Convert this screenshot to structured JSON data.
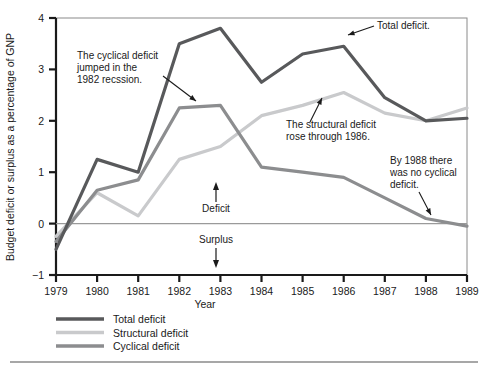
{
  "chart_data": {
    "type": "line",
    "title": "",
    "xlabel": "Year",
    "ylabel": "Budget deficit or surplus as a percentage of GNP",
    "x": [
      1979,
      1980,
      1981,
      1982,
      1983,
      1984,
      1985,
      1986,
      1987,
      1988,
      1989
    ],
    "categories": [
      "1979",
      "1980",
      "1981",
      "1982",
      "1983",
      "1984",
      "1985",
      "1986",
      "1987",
      "1988",
      "1989"
    ],
    "xlim": [
      1979,
      1989
    ],
    "ylim": [
      -1,
      4
    ],
    "yticks": [
      "-1",
      "0",
      "1",
      "2",
      "3",
      "4"
    ],
    "ytick_values": [
      -1,
      0,
      1,
      2,
      3,
      4
    ],
    "grid": false,
    "legend_position": "below-left",
    "zero_line": 0,
    "series": [
      {
        "name": "Total deficit",
        "color": "#58595b",
        "width": 3.2,
        "values": [
          -0.5,
          1.25,
          1.0,
          3.5,
          3.8,
          2.75,
          3.3,
          3.45,
          2.45,
          2.0,
          2.05
        ]
      },
      {
        "name": "Structural deficit",
        "color": "#c9cacc",
        "width": 3.2,
        "values": [
          -0.25,
          0.6,
          0.15,
          1.25,
          1.5,
          2.1,
          2.3,
          2.55,
          2.15,
          2.0,
          2.25
        ]
      },
      {
        "name": "Cyclical deficit",
        "color": "#8c8d8f",
        "width": 3.2,
        "values": [
          -0.35,
          0.65,
          0.85,
          2.25,
          2.3,
          1.1,
          1.0,
          0.9,
          0.5,
          0.1,
          -0.05
        ]
      }
    ],
    "annotations": [
      {
        "id": "cyclical-recession-note",
        "text_lines": [
          "The cyclical deficit",
          "jumped in the",
          "1982 recssion."
        ],
        "text_x": 77,
        "text_y": 59,
        "arrow": {
          "x1": 163,
          "y1": 76,
          "x2": 196,
          "y2": 101
        }
      },
      {
        "id": "structural-rose-note",
        "text_lines": [
          "The structural deficit",
          "rose through 1986."
        ],
        "text_x": 286,
        "text_y": 128,
        "arrow": {
          "x1": 310,
          "y1": 122,
          "x2": 322,
          "y2": 98
        }
      },
      {
        "id": "total-deficit-note",
        "text_lines": [
          "Total deficit."
        ],
        "text_x": 377,
        "text_y": 29,
        "arrow": {
          "x1": 374,
          "y1": 26,
          "x2": 348,
          "y2": 35
        }
      },
      {
        "id": "no-cyclical-1988-note",
        "text_lines": [
          "By 1988 there",
          "was no cyclical",
          "deficit."
        ],
        "text_x": 390,
        "text_y": 164,
        "arrow": {
          "x1": 419,
          "y1": 192,
          "x2": 431,
          "y2": 215
        }
      }
    ],
    "zone_labels": [
      {
        "id": "deficit",
        "text": "Deficit",
        "x": 216,
        "y": 212,
        "arrow_dir": "up"
      },
      {
        "id": "surplus",
        "text": "Surplus",
        "x": 216,
        "y": 243,
        "arrow_dir": "down"
      }
    ]
  },
  "legend": {
    "items": [
      {
        "label": "Total deficit",
        "color": "#58595b"
      },
      {
        "label": "Structural deficit",
        "color": "#c9cacc"
      },
      {
        "label": "Cyclical deficit",
        "color": "#8c8d8f"
      }
    ]
  },
  "colors": {
    "total": "#58595b",
    "structural": "#c9cacc",
    "cyclical": "#8c8d8f",
    "axis": "#1a1a1a",
    "zero_line": "#9a9a9a",
    "frame": "#8a8a8a",
    "rule": "#8a8a8a",
    "background": "#ffffff"
  }
}
